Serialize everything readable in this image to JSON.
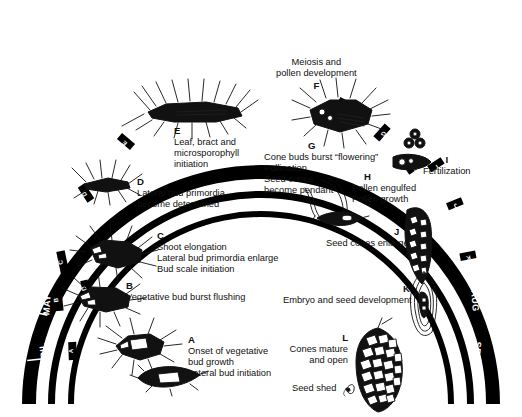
{
  "figure": {
    "background_color": "#ffffff",
    "band_color": "#000000",
    "text_color": "#111111"
  },
  "rings": {
    "outer": {
      "name": "outer-month-ring",
      "months": [
        "NOV • FEB",
        "OCT",
        "SEPT",
        "AUG",
        "JULY",
        "JUNE",
        "MAY",
        "APRIL",
        "MARCH",
        "APRIL",
        "MAY",
        "JUNE",
        "JULY",
        "AUG",
        "SEPT"
      ]
    },
    "middle": {
      "name": "middle-stage-ring",
      "ticks": [
        "B",
        "C",
        "D",
        "E",
        "F",
        "G",
        "H"
      ]
    },
    "inner": {
      "name": "inner-stage-ring",
      "ticks": [
        "A",
        "I",
        "J",
        "K",
        "L"
      ]
    }
  },
  "month_labels": {
    "top_center": "NOV • FEB",
    "left": [
      "OCT",
      "SEPT",
      "AUG",
      "JULY",
      "JUNE",
      "MAY",
      "APRIL"
    ],
    "right": [
      "MARCH",
      "APRIL",
      "MAY",
      "JUNE",
      "JULY",
      "AUG",
      "SEPT"
    ]
  },
  "stages": [
    {
      "id": "A",
      "letter": "A",
      "lines": [
        "Onset of vegetative",
        "bud growth",
        "Lateral bud initiation"
      ],
      "illustration": "vegetative-bud"
    },
    {
      "id": "B",
      "letter": "B",
      "lines": [
        "Vegetative bud burst flushing"
      ],
      "illustration": "bursting-bud"
    },
    {
      "id": "C",
      "letter": "C",
      "lines": [
        "Shoot elongation",
        "Lateral bud primordia enlarge",
        "Bud scale initiation"
      ],
      "illustration": "elongating-shoot"
    },
    {
      "id": "D",
      "letter": "D",
      "lines": [
        "Lateral bud primordia",
        "become determined"
      ],
      "illustration": "needle-shoot"
    },
    {
      "id": "E",
      "letter": "E",
      "lines": [
        "Leaf, bract and",
        "microsporophyll",
        "initiation"
      ],
      "illustration": "bud-longitudinal-section"
    },
    {
      "id": "F",
      "letter": "F",
      "lines": [
        "Meiosis and",
        "pollen development"
      ],
      "illustration": "pollen-cone-cluster"
    },
    {
      "id": "G",
      "letter": "G",
      "lines": [
        "Cone buds burst “flowering”",
        "Pollination",
        "Seed cones",
        "become pendant"
      ],
      "illustration": "pendant-seed-cone"
    },
    {
      "id": "H",
      "letter": "H",
      "lines": [
        "Pollen engulfed",
        "Pollen growth"
      ],
      "illustration": "ovule-with-pollen"
    },
    {
      "id": "I",
      "letter": "I",
      "lines": [
        "Fertilization"
      ],
      "illustration": "egg-and-pollen-tube"
    },
    {
      "id": "J",
      "letter": "J",
      "lines": [
        "Seed cones enlarge"
      ],
      "illustration": "young-seed-cone"
    },
    {
      "id": "K",
      "letter": "K",
      "lines": [
        "Embryo and seed development"
      ],
      "illustration": "seed-with-embryo"
    },
    {
      "id": "L",
      "letter": "L",
      "lines": [
        "Cones mature",
        "and open"
      ],
      "illustration": "mature-open-cone"
    }
  ],
  "annotations": [
    {
      "id": "seed-shed",
      "text": "Seed shed"
    }
  ]
}
